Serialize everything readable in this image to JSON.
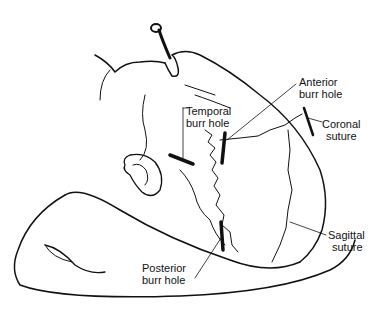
{
  "figure": {
    "labels": {
      "anterior": [
        "Anterior",
        "burr hole"
      ],
      "temporal": [
        "Temporal",
        "burr hole"
      ],
      "coronal": [
        "Coronal",
        "suture"
      ],
      "sagittal": [
        "Sagittal",
        "suture"
      ],
      "posterior": [
        "Posterior",
        "burr hole"
      ]
    },
    "colors": {
      "ink": "#111111",
      "background": "#ffffff"
    }
  }
}
